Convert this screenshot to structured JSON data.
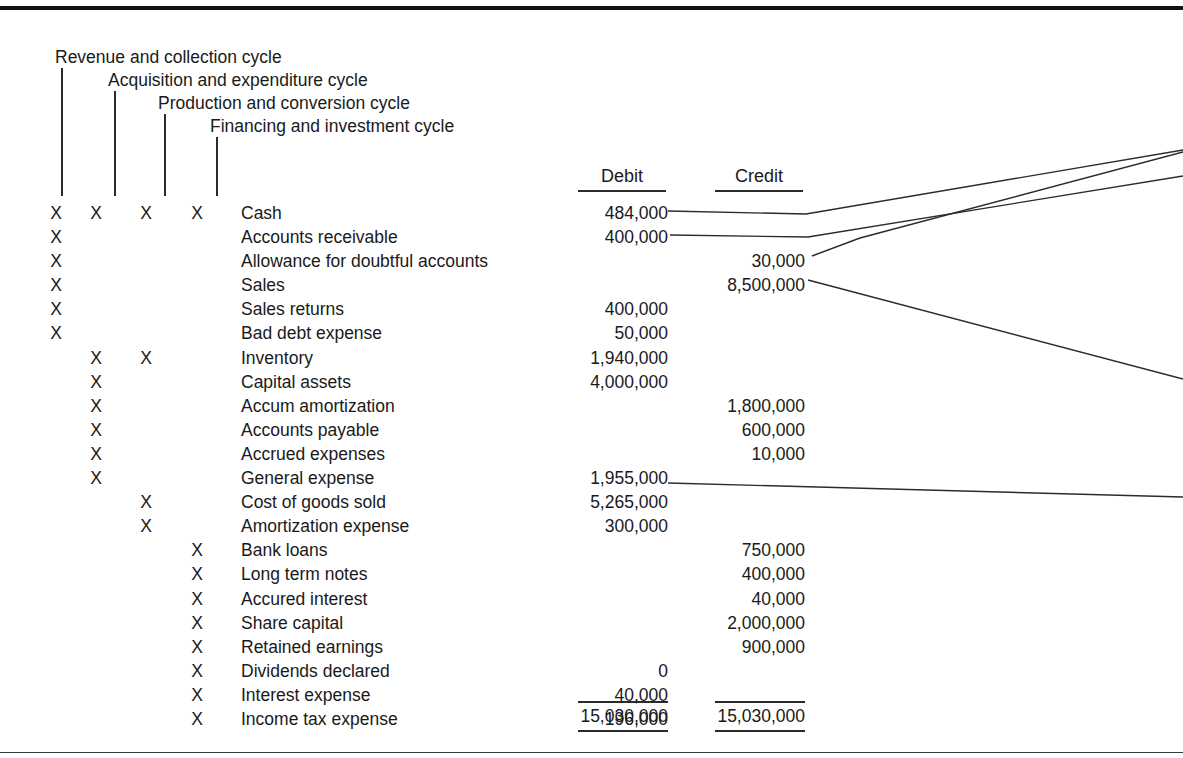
{
  "cycles": [
    {
      "label": "Revenue and collection cycle",
      "x": 55,
      "y": 47,
      "leader_x": 61,
      "leader_top": 68,
      "leader_bottom": 196
    },
    {
      "label": "Acquisition and expenditure cycle",
      "x": 108,
      "y": 70,
      "leader_x": 114,
      "leader_top": 91,
      "leader_bottom": 196
    },
    {
      "label": "Production and conversion cycle",
      "x": 158,
      "y": 93,
      "leader_x": 164,
      "leader_top": 114,
      "leader_bottom": 196
    },
    {
      "label": "Financing and investment cycle",
      "x": 210,
      "y": 116,
      "leader_x": 216,
      "leader_top": 137,
      "leader_bottom": 196
    }
  ],
  "columns": {
    "debit_label": "Debit",
    "credit_label": "Credit"
  },
  "rows": [
    {
      "marks": [
        true,
        true,
        true,
        true
      ],
      "account": "Cash",
      "debit": "484,000",
      "credit": ""
    },
    {
      "marks": [
        true,
        false,
        false,
        false
      ],
      "account": "Accounts receivable",
      "debit": "400,000",
      "credit": ""
    },
    {
      "marks": [
        true,
        false,
        false,
        false
      ],
      "account": "Allowance for doubtful accounts",
      "debit": "",
      "credit": "30,000"
    },
    {
      "marks": [
        true,
        false,
        false,
        false
      ],
      "account": "Sales",
      "debit": "",
      "credit": "8,500,000"
    },
    {
      "marks": [
        true,
        false,
        false,
        false
      ],
      "account": "Sales returns",
      "debit": "400,000",
      "credit": ""
    },
    {
      "marks": [
        true,
        false,
        false,
        false
      ],
      "account": "Bad debt expense",
      "debit": "50,000",
      "credit": ""
    },
    {
      "marks": [
        false,
        true,
        true,
        false
      ],
      "account": "Inventory",
      "debit": "1,940,000",
      "credit": ""
    },
    {
      "marks": [
        false,
        true,
        false,
        false
      ],
      "account": "Capital assets",
      "debit": "4,000,000",
      "credit": ""
    },
    {
      "marks": [
        false,
        true,
        false,
        false
      ],
      "account": "Accum amortization",
      "debit": "",
      "credit": "1,800,000"
    },
    {
      "marks": [
        false,
        true,
        false,
        false
      ],
      "account": "Accounts payable",
      "debit": "",
      "credit": "600,000"
    },
    {
      "marks": [
        false,
        true,
        false,
        false
      ],
      "account": "Accrued expenses",
      "debit": "",
      "credit": "10,000"
    },
    {
      "marks": [
        false,
        true,
        false,
        false
      ],
      "account": "General expense",
      "debit": "1,955,000",
      "credit": ""
    },
    {
      "marks": [
        false,
        false,
        true,
        false
      ],
      "account": "Cost of goods sold",
      "debit": "5,265,000",
      "credit": ""
    },
    {
      "marks": [
        false,
        false,
        true,
        false
      ],
      "account": "Amortization expense",
      "debit": "300,000",
      "credit": ""
    },
    {
      "marks": [
        false,
        false,
        false,
        true
      ],
      "account": "Bank loans",
      "debit": "",
      "credit": "750,000"
    },
    {
      "marks": [
        false,
        false,
        false,
        true
      ],
      "account": "Long term notes",
      "debit": "",
      "credit": "400,000"
    },
    {
      "marks": [
        false,
        false,
        false,
        true
      ],
      "account": "Accured interest",
      "debit": "",
      "credit": "40,000"
    },
    {
      "marks": [
        false,
        false,
        false,
        true
      ],
      "account": "Share capital",
      "debit": "",
      "credit": "2,000,000"
    },
    {
      "marks": [
        false,
        false,
        false,
        true
      ],
      "account": "Retained earnings",
      "debit": "",
      "credit": "900,000"
    },
    {
      "marks": [
        false,
        false,
        false,
        true
      ],
      "account": "Dividends declared",
      "debit": "0",
      "credit": ""
    },
    {
      "marks": [
        false,
        false,
        false,
        true
      ],
      "account": "Interest expense",
      "debit": "40,000",
      "credit": ""
    },
    {
      "marks": [
        false,
        false,
        false,
        true
      ],
      "account": "Income tax expense",
      "debit": "196,000",
      "credit": ""
    }
  ],
  "totals": {
    "debit": "15,030,000",
    "credit": "15,030,000"
  },
  "mark_symbol": "X",
  "connectors": [
    {
      "name": "cash-connector",
      "points": "668,211 806,214 1183,150"
    },
    {
      "name": "receivable-connector",
      "points": "670,235 808,237 1183,176"
    },
    {
      "name": "allowance-connector",
      "points": "812,256 860,238 1183,152"
    },
    {
      "name": "sales-connector",
      "points": "808,280 1183,379"
    },
    {
      "name": "cogs-connector",
      "points": "668,483 1183,497"
    }
  ],
  "colors": {
    "ink": "#1a1a1a",
    "rule": "#2b2b2b",
    "page_rule": "#111111",
    "background": "#ffffff"
  }
}
